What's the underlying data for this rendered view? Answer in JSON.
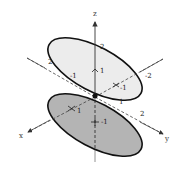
{
  "figure": {
    "type": "3d-surface-diagram",
    "axes": {
      "x": {
        "label": "x"
      },
      "y": {
        "label": "y"
      },
      "z": {
        "label": "z"
      }
    },
    "upper_ellipse": {
      "fill": "#ececec",
      "stroke": "#111111",
      "tick_labels": {
        "z_top": "2",
        "z_mid": "1",
        "left_far": "2",
        "left_near": "-1",
        "right_far": "-2",
        "right_near": "-1"
      }
    },
    "lower_ellipse": {
      "fill": "#b4b4b4",
      "stroke": "#111111",
      "tick_labels": {
        "x_near": "1",
        "z_neg": "-1",
        "y_near": "1",
        "y_far": "2"
      }
    },
    "colors": {
      "axis": "#444444",
      "background": "#ffffff"
    }
  }
}
